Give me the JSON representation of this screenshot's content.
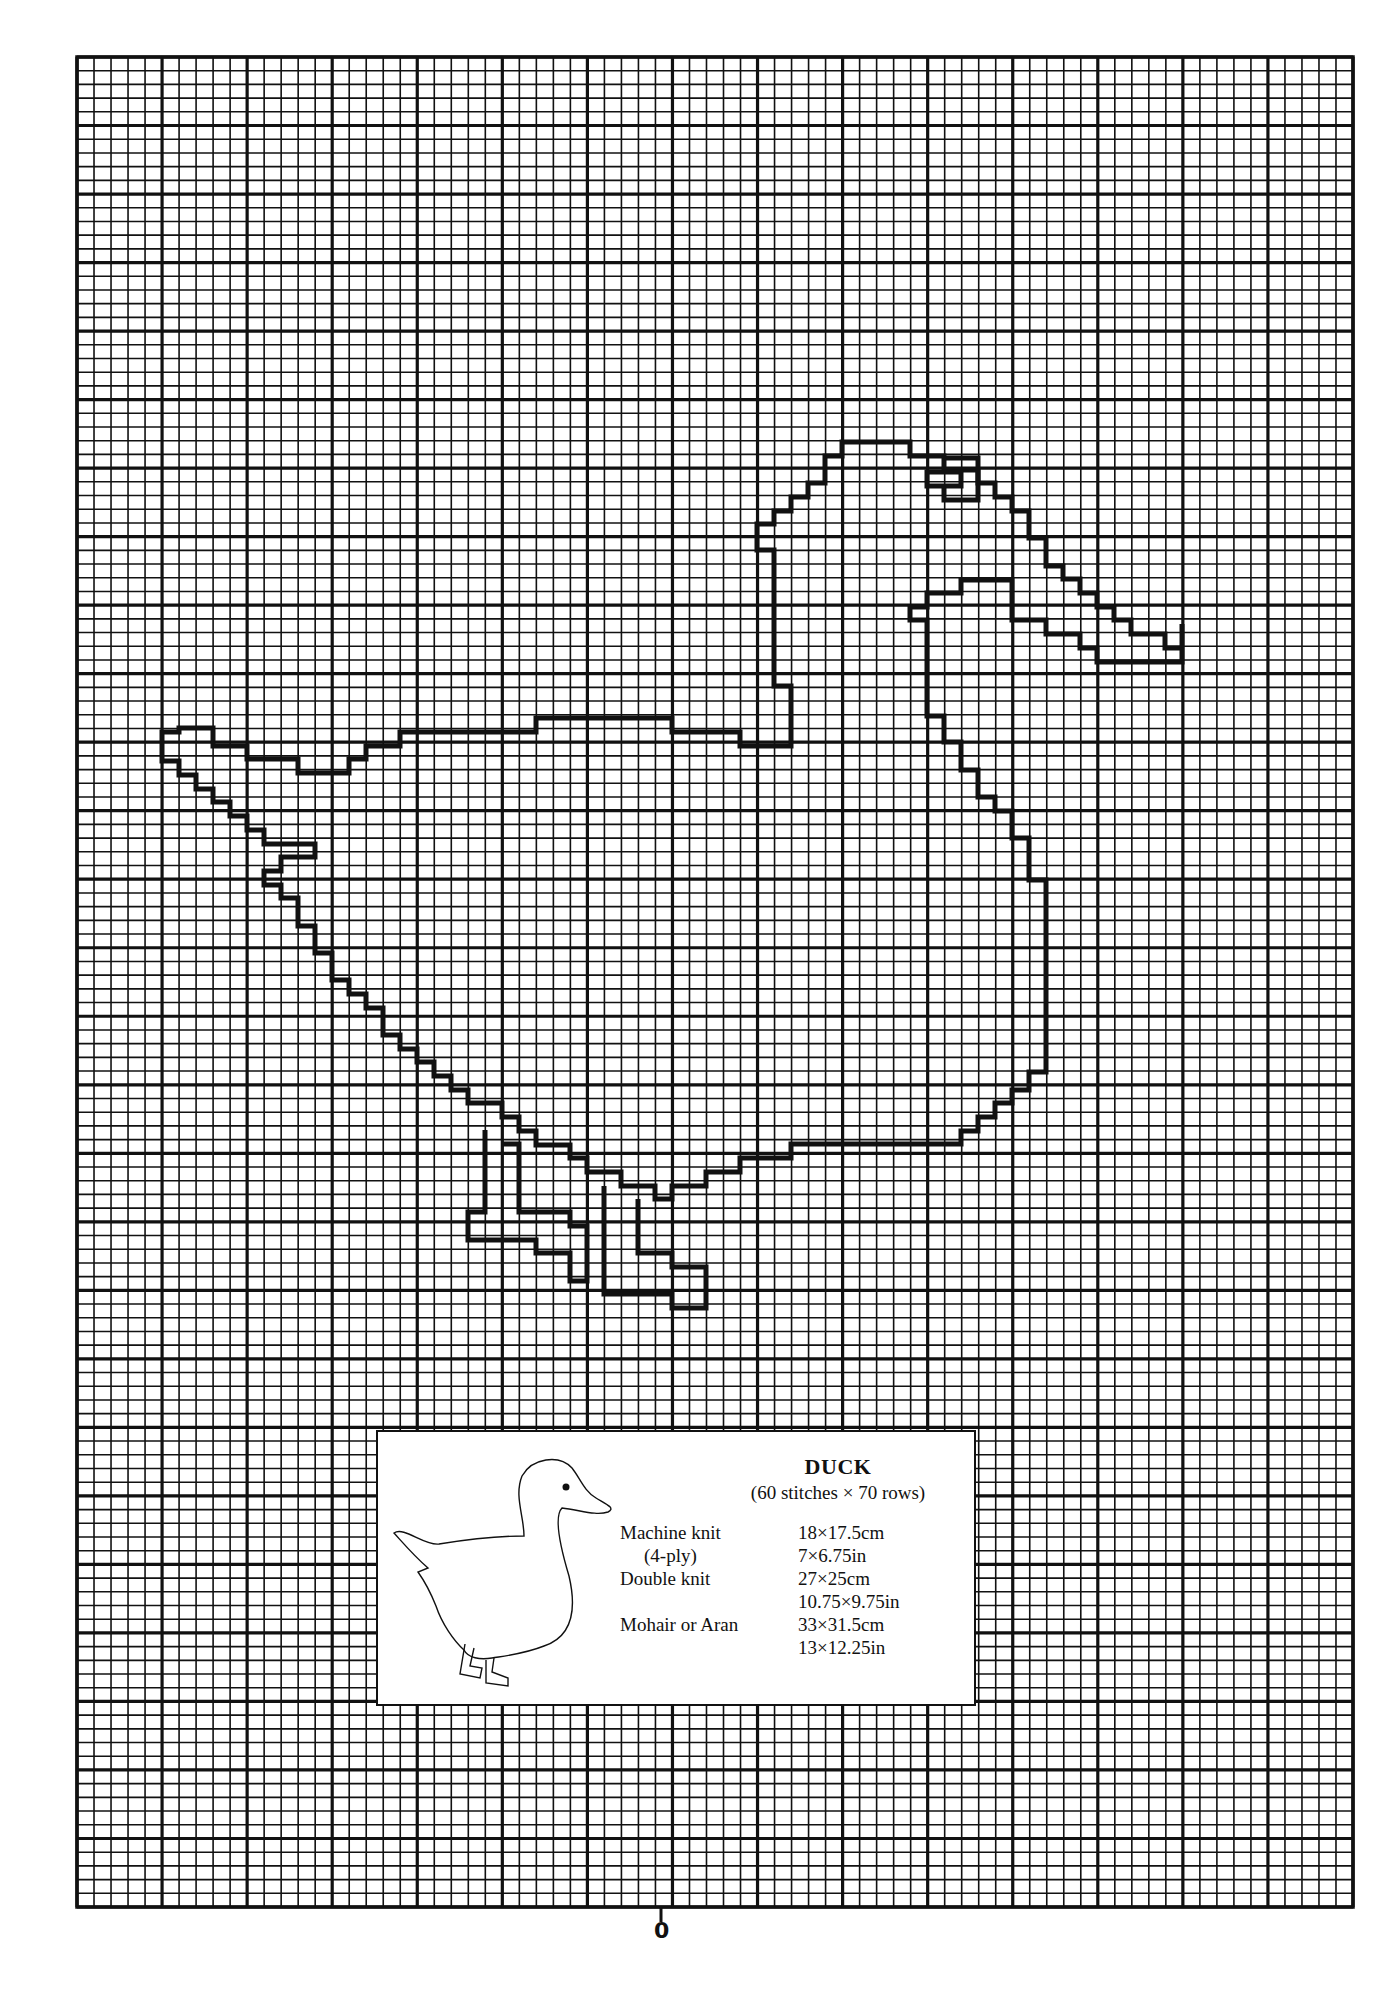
{
  "chart": {
    "columns": 75,
    "rows": 135,
    "major_every": 5,
    "line_color": "#111111",
    "paper_color": "#ffffff"
  },
  "pattern": {
    "name": "DUCK",
    "size": "(60 stitches × 70 rows)",
    "specs": [
      {
        "label": "Machine knit",
        "value": "18×17.5cm"
      },
      {
        "label": "(4-ply)",
        "value": "7×6.75in"
      },
      {
        "label": "Double knit",
        "value": "27×25cm"
      },
      {
        "label": "",
        "value": "10.75×9.75in"
      },
      {
        "label": "Mohair or Aran",
        "value": "33×31.5cm"
      },
      {
        "label": "",
        "value": "13×12.25in"
      }
    ]
  },
  "axis": {
    "center_marker": "0"
  }
}
